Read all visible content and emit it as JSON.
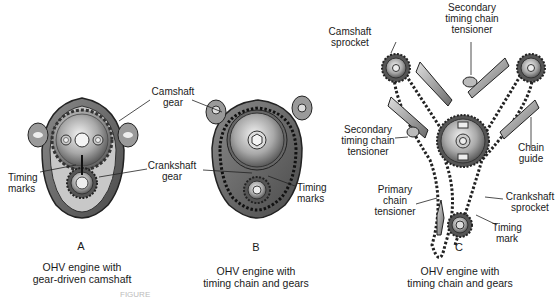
{
  "panels": [
    {
      "letter": "A",
      "caption_line1": "OHV engine with",
      "caption_line2": "gear-driven camshaft",
      "labels": {
        "camshaft_gear_1": "Camshaft",
        "camshaft_gear_2": "gear",
        "crankshaft_gear_1": "Crankshaft",
        "crankshaft_gear_2": "gear",
        "timing_marks_1": "Timing",
        "timing_marks_2": "marks"
      }
    },
    {
      "letter": "B",
      "caption_line1": "OHV engine with",
      "caption_line2": "timing chain and gears",
      "labels": {
        "timing_marks_1": "Timing",
        "timing_marks_2": "marks"
      }
    },
    {
      "letter": "C",
      "caption_line1": "OHV engine with",
      "caption_line2": "timing chain and gears",
      "labels": {
        "camshaft_sprocket_1": "Camshaft",
        "camshaft_sprocket_2": "sprocket",
        "secondary_top_1": "Secondary",
        "secondary_top_2": "timing chain",
        "secondary_top_3": "tensioner",
        "secondary_left_1": "Secondary",
        "secondary_left_2": "timing chain",
        "secondary_left_3": "tensioner",
        "chain_guide_1": "Chain",
        "chain_guide_2": "guide",
        "primary_tensioner_1": "Primary",
        "primary_tensioner_2": "chain",
        "primary_tensioner_3": "tensioner",
        "crankshaft_sprocket_1": "Crankshaft",
        "crankshaft_sprocket_2": "sprocket",
        "timing_mark_1": "Timing",
        "timing_mark_2": "mark"
      }
    }
  ],
  "figure_caption": "FIGURE"
}
